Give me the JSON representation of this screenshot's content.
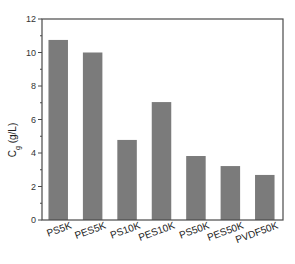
{
  "chart_data": {
    "type": "bar",
    "title": "",
    "xlabel": "",
    "ylabel": "C_g (g/L)",
    "ylabel_main": "C",
    "ylabel_sub": "g",
    "ylabel_unit": " (g/L)",
    "categories": [
      "PS5K",
      "PES5K",
      "PS10K",
      "PES10K",
      "PS50K",
      "PES50K",
      "PVDF50K"
    ],
    "values": [
      10.75,
      10.0,
      4.78,
      7.04,
      3.82,
      3.22,
      2.69
    ],
    "ylim": [
      0,
      12
    ],
    "yticks": [
      0,
      2,
      4,
      6,
      8,
      10,
      12
    ],
    "grid": false,
    "legend": null,
    "bar_color": "#7b7b7b",
    "axis_color": "#4a4a4a"
  }
}
